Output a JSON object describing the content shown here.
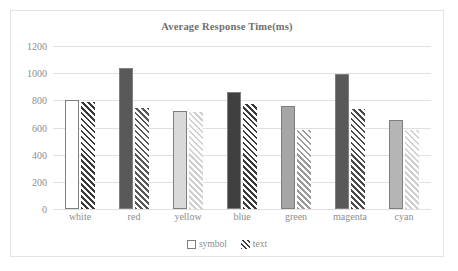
{
  "chart_data": {
    "type": "bar",
    "title": "Average Response Time(ms)",
    "xlabel": "",
    "ylabel": "",
    "ylim": [
      0,
      1200
    ],
    "yticks": [
      0,
      200,
      400,
      600,
      800,
      1000,
      1200
    ],
    "ytick_labels": [
      "0",
      "200",
      "400",
      "600",
      "800",
      "1000",
      "1200"
    ],
    "grid": true,
    "legend_position": "bottom",
    "categories": [
      "white",
      "red",
      "yellow",
      "blue",
      "green",
      "magenta",
      "cyan"
    ],
    "series": [
      {
        "name": "symbol",
        "fill": "solid",
        "values": [
          800,
          1035,
          725,
          865,
          760,
          995,
          655
        ],
        "colors": [
          "#ffffff",
          "#595959",
          "#d9d9d9",
          "#404040",
          "#a6a6a6",
          "#595959",
          "#b5b5b5"
        ]
      },
      {
        "name": "text",
        "fill": "hatched",
        "values": [
          785,
          745,
          715,
          770,
          585,
          735,
          585
        ],
        "colors": [
          "#3a3a3a",
          "#595959",
          "#cfcfcf",
          "#3a3a3a",
          "#9a9a9a",
          "#4a4a4a",
          "#cfcfcf"
        ]
      }
    ]
  },
  "legend": {
    "items": [
      {
        "label": "symbol"
      },
      {
        "label": "text"
      }
    ]
  },
  "colors": {
    "frame_border": "#e3e3e3",
    "gridline": "#e0e0e0",
    "axis_text": "#8d8d8d",
    "title_text": "#6f6f6f"
  }
}
